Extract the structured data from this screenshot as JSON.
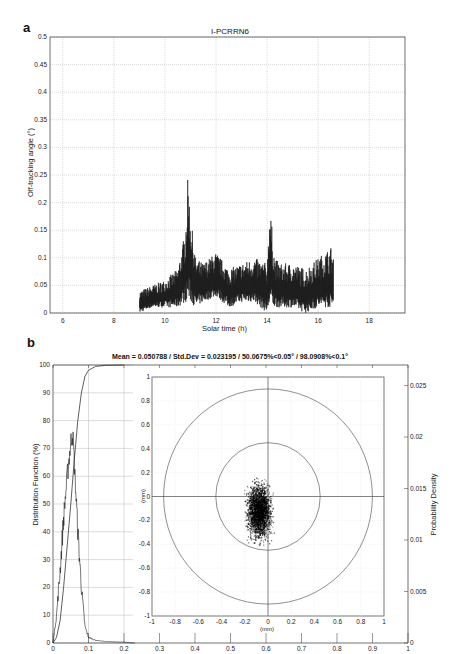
{
  "chart_data": [
    {
      "panel": "a",
      "type": "line",
      "title": "I-PCRRN6",
      "xlabel": "Solar time (h)",
      "ylabel": "Off-tracking angle (°)",
      "xlim": [
        5.5,
        19.4
      ],
      "ylim": [
        0,
        0.5
      ],
      "xticks": [
        "6",
        "8",
        "10",
        "12",
        "14",
        "16",
        "18"
      ],
      "yticks": [
        "0",
        "0.05",
        "0.1",
        "0.15",
        "0.2",
        "0.25",
        "0.3",
        "0.35",
        "0.4",
        "0.45",
        "0.5"
      ],
      "grid": true,
      "series": [
        {
          "name": "off-tracking angle (envelope)",
          "x": [
            9.0,
            9.5,
            10.0,
            10.5,
            10.8,
            10.9,
            11.0,
            11.2,
            11.5,
            12.0,
            12.5,
            13.0,
            13.5,
            14.0,
            14.1,
            14.3,
            14.5,
            15.0,
            15.5,
            16.0,
            16.5,
            16.6
          ],
          "upper": [
            0.04,
            0.05,
            0.06,
            0.08,
            0.15,
            0.25,
            0.18,
            0.1,
            0.09,
            0.11,
            0.08,
            0.09,
            0.1,
            0.09,
            0.2,
            0.1,
            0.09,
            0.09,
            0.08,
            0.1,
            0.12,
            0.11
          ],
          "lower": [
            0.0,
            0.01,
            0.01,
            0.01,
            0.02,
            0.02,
            0.02,
            0.01,
            0.02,
            0.03,
            0.01,
            0.02,
            0.02,
            0.0,
            0.01,
            0.01,
            0.01,
            0.01,
            0.0,
            0.01,
            0.01,
            0.01
          ]
        }
      ]
    },
    {
      "panel": "b",
      "type": "line",
      "title": "Mean = 0.050788 / Std.Dev = 0.023195 / 50.0675%<0.05° / 98.0908%<0.1°",
      "xlabel": "",
      "ylabel": "Distribution Function (%)",
      "ylabel_right": "Probability Density",
      "xlim": [
        0,
        1
      ],
      "ylim": [
        0,
        100
      ],
      "ylim_right": [
        0,
        0.027
      ],
      "xticks": [
        "0",
        "0.1",
        "0.2",
        "0.3",
        "0.4",
        "0.5",
        "0.6",
        "0.7",
        "0.8",
        "0.9",
        "1"
      ],
      "yticks": [
        "0",
        "10",
        "20",
        "30",
        "40",
        "50",
        "60",
        "70",
        "80",
        "90",
        "100"
      ],
      "yticks_right": [
        "0",
        "0.005",
        "0.01",
        "0.015",
        "0.02",
        "0.025"
      ],
      "grid": true,
      "series": [
        {
          "name": "Cumulative distribution (%)",
          "x": [
            0,
            0.01,
            0.02,
            0.03,
            0.04,
            0.05,
            0.06,
            0.07,
            0.08,
            0.09,
            0.1,
            0.12,
            0.15,
            0.2
          ],
          "values": [
            0,
            2,
            8,
            20,
            35,
            50,
            66,
            80,
            90,
            96,
            98.1,
            99.5,
            99.9,
            100
          ]
        },
        {
          "name": "Probability density (histogram, % scale)",
          "x": [
            0,
            0.01,
            0.02,
            0.03,
            0.04,
            0.05,
            0.055,
            0.06,
            0.07,
            0.08,
            0.09,
            0.1,
            0.12,
            0.15,
            0.2,
            0.23
          ],
          "values": [
            0,
            10,
            26,
            45,
            60,
            72,
            76,
            65,
            40,
            20,
            6,
            2,
            1,
            0.5,
            0.3,
            0
          ]
        }
      ],
      "inset": {
        "type": "scatter",
        "xlabel": "(mm)",
        "ylabel": "(mm)",
        "xlim": [
          -1,
          1
        ],
        "ylim": [
          -1,
          1
        ],
        "xticks": [
          "-1",
          "-0.8",
          "-0.6",
          "-0.4",
          "-0.2",
          "0",
          "0.2",
          "0.4",
          "0.6",
          "0.8",
          "1"
        ],
        "yticks": [
          "-1",
          "-0.8",
          "-0.6",
          "-0.4",
          "-0.2",
          "0",
          "0.2",
          "0.4",
          "0.6",
          "0.8",
          "1"
        ],
        "circles": [
          {
            "label": "0.1°",
            "radius_mm": 0.45
          },
          {
            "label": "0.2°",
            "radius_mm": 0.9
          }
        ],
        "cloud": {
          "center_x": -0.08,
          "center_y": -0.12,
          "spread_x": 0.1,
          "spread_y": 0.22
        }
      }
    }
  ],
  "labels": {
    "panel_a": "a",
    "panel_b": "b",
    "a_title": "I-PCRRN6",
    "a_xlabel": "Solar time (h)",
    "a_ylabel": "Off-tracking angle (°)",
    "b_title": "Mean = 0.050788 / Std.Dev = 0.023195 / 50.0675%<0.05° / 98.0908%<0.1°",
    "b_ylabel": "Distribution Function (%)",
    "b_ylabel_right": "Probability Density",
    "inset_xlabel": "(mm)",
    "inset_ylabel": "(mm)",
    "circle_inner": "0.1°",
    "circle_outer": "0.2°"
  },
  "colors": {
    "trace": "#1a1a1a",
    "grid": "#b8b8b8",
    "axis": "#333333"
  }
}
